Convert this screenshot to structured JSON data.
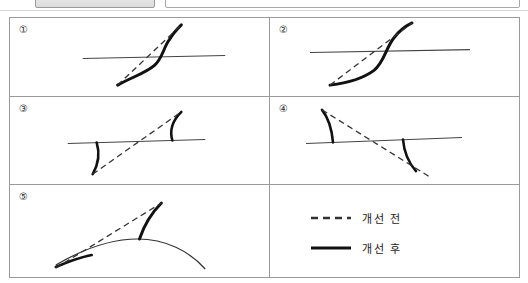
{
  "toolbar": {
    "button_label": "",
    "input_value": ""
  },
  "figure": {
    "panels": [
      {
        "number": "①",
        "name": "panel-1",
        "shape": "s-curve-crossing-horizontal-line"
      },
      {
        "number": "②",
        "name": "panel-2",
        "shape": "s-curve-crossing-horizontal-line-steep"
      },
      {
        "number": "③",
        "name": "panel-3",
        "shape": "horizontal-line-with-down-left-and-up-right-hooks"
      },
      {
        "number": "④",
        "name": "panel-4",
        "shape": "horizontal-line-with-up-left-and-down-right-hooks"
      },
      {
        "number": "⑤",
        "name": "panel-5",
        "shape": "dome-arc-with-rising-curve-at-apex"
      }
    ]
  },
  "legend": {
    "items": [
      {
        "label": "개선 전",
        "style": "dashed",
        "color": "#333333"
      },
      {
        "label": "개선 후",
        "style": "solid",
        "color": "#111111"
      }
    ]
  },
  "colors": {
    "border": "#9b9b9b",
    "thin_line": "#444444",
    "thick_line": "#111111",
    "dashed_line": "#333333",
    "background": "#ffffff"
  }
}
